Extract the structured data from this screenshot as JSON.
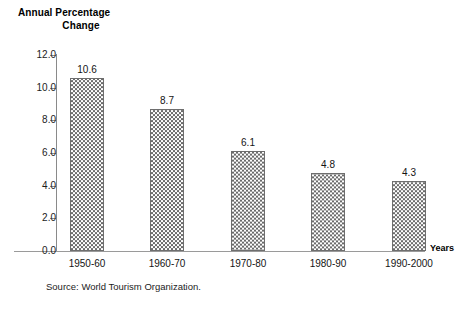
{
  "chart_data": {
    "type": "bar",
    "title": "Annual Percentage Change",
    "title_line1": "Annual Percentage",
    "title_line2": "Change",
    "categories": [
      "1950-60",
      "1960-70",
      "1970-80",
      "1980-90",
      "1990-2000"
    ],
    "values": [
      10.6,
      8.7,
      6.1,
      4.8,
      4.3
    ],
    "value_labels": [
      "10.6",
      "8.7",
      "6.1",
      "4.8",
      "4.3"
    ],
    "xlabel": "Years",
    "ylabel": "Annual Percentage Change",
    "ylim": [
      0.0,
      12.0
    ],
    "ytick_values": [
      12.0,
      10.0,
      8.0,
      6.0,
      4.0,
      2.0,
      0.0
    ],
    "ytick_labels": [
      "12.0",
      "10.0",
      "8.0",
      "6.0",
      "4.0",
      "2.0",
      "0.0"
    ],
    "grid": false,
    "legend": "none",
    "series": [
      {
        "name": "Annual Percentage Change",
        "values": [
          10.6,
          8.7,
          6.1,
          4.8,
          4.3
        ]
      }
    ],
    "annotations": {
      "source": "Source: World Tourism Organization."
    },
    "colors": {
      "bar_fill": "#6b6b6b",
      "bar_background": "#ffffff",
      "bar_border": "#6e6e6e",
      "axis": "#8a8a8a",
      "text": "#141414"
    }
  },
  "footer": {
    "source": "Source: World Tourism Organization."
  }
}
